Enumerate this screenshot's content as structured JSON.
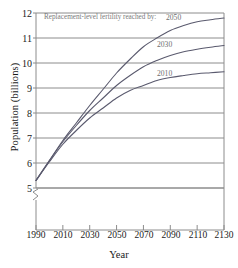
{
  "chart_data": {
    "type": "line",
    "title": "",
    "xlabel": "Year",
    "ylabel": "Population (billions)",
    "xlim": [
      1990,
      2130
    ],
    "ylim": [
      5,
      12
    ],
    "yaxis_break": true,
    "grid": true,
    "grid_orientation": "horizontal",
    "xticks": [
      1990,
      2010,
      2030,
      2050,
      2070,
      2090,
      2110,
      2130
    ],
    "yticks": [
      5,
      6,
      7,
      8,
      9,
      10,
      11,
      12
    ],
    "annotation": "Replacement-level fertility reached by:",
    "legend_position": "inline-curve-labels",
    "x": [
      1990,
      2000,
      2010,
      2020,
      2030,
      2040,
      2050,
      2060,
      2070,
      2080,
      2090,
      2100,
      2110,
      2120,
      2130
    ],
    "series": [
      {
        "name": "2050",
        "label": "2050",
        "color": "#5a5a6e",
        "values": [
          5.3,
          6.1,
          6.9,
          7.6,
          8.3,
          8.95,
          9.6,
          10.15,
          10.65,
          11.0,
          11.3,
          11.5,
          11.65,
          11.73,
          11.8
        ]
      },
      {
        "name": "2030",
        "label": "2030",
        "color": "#5a5a6e",
        "values": [
          5.3,
          6.1,
          6.85,
          7.5,
          8.1,
          8.6,
          9.1,
          9.5,
          9.85,
          10.1,
          10.3,
          10.45,
          10.55,
          10.63,
          10.7
        ]
      },
      {
        "name": "2010",
        "label": "2010",
        "color": "#5a5a6e",
        "values": [
          5.3,
          6.05,
          6.75,
          7.3,
          7.8,
          8.2,
          8.6,
          8.9,
          9.1,
          9.3,
          9.42,
          9.5,
          9.57,
          9.61,
          9.65
        ]
      }
    ]
  },
  "axis": {
    "ylabel": "Population (billions)",
    "xlabel": "Year",
    "ytick_labels": [
      "12",
      "11",
      "10",
      "9",
      "8",
      "7",
      "6",
      "5"
    ],
    "xtick_labels": [
      "1990",
      "2010",
      "2030",
      "2050",
      "2070",
      "2090",
      "2110",
      "2130"
    ]
  },
  "annotations": {
    "fertility_note": "Replacement-level fertility reached by:",
    "curve_2050": "2050",
    "curve_2030": "2030",
    "curve_2010": "2010"
  },
  "colors": {
    "curve": "#5a5a6e",
    "grid": "#8c8c8c",
    "frame": "#8c8c8c",
    "text": "#1a1a1a",
    "annotation_text": "#7a7a7a"
  }
}
